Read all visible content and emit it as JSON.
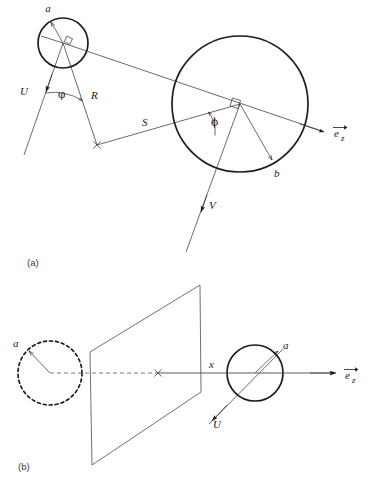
{
  "figure": {
    "panels": [
      {
        "id": "a",
        "label": "(a)"
      },
      {
        "id": "b",
        "label": "(b)"
      }
    ],
    "panel_a": {
      "labels": {
        "radius_small": "a",
        "radius_big": "b",
        "angle_small": "φ",
        "angle_big": "ϕ",
        "distance_r": "R",
        "distance_s": "S",
        "velocity_u": "U",
        "velocity_v": "V",
        "axis": "e",
        "axis_sub": "z"
      },
      "geometry": {
        "small_circle": {
          "cx": 63,
          "cy": 43,
          "r": 25
        },
        "big_circle": {
          "cx": 240,
          "cy": 104,
          "r": 68
        },
        "cross_point": {
          "x": 97,
          "y": 145
        },
        "axis_arrow_tip": {
          "x": 322,
          "y": 131
        }
      }
    },
    "panel_b": {
      "labels": {
        "radius_dashed": "a",
        "radius_solid": "a",
        "offset": "x",
        "velocity_u": "U",
        "axis": "e",
        "axis_sub": "z"
      },
      "geometry": {
        "dashed_circle": {
          "cx": 50,
          "cy": 373,
          "r": 32
        },
        "solid_circle": {
          "cx": 255,
          "cy": 373,
          "r": 28
        },
        "cross_point": {
          "x": 158,
          "y": 373
        },
        "plane_points": "200,285 90,352 92,465 201,392",
        "axis_arrow_tip": {
          "x": 332,
          "y": 373
        }
      }
    },
    "colors": {
      "ink": "#1a1a1a",
      "thin": "#2b2b2b",
      "axis": "#4a4a4a",
      "plane": "#606060",
      "background": "#ffffff"
    }
  }
}
